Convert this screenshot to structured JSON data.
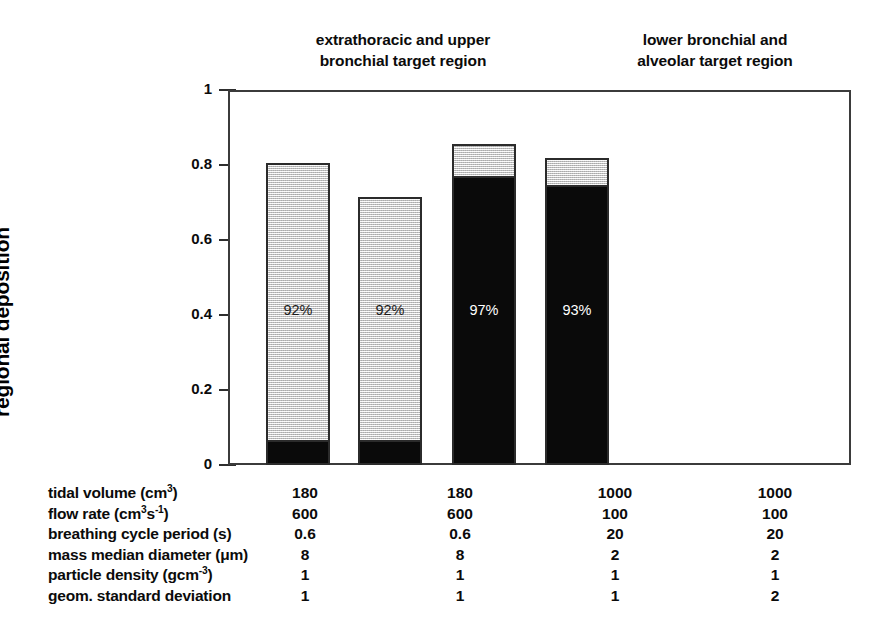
{
  "chart_data": {
    "type": "bar",
    "title": "",
    "subtitle": "",
    "xlabel": "",
    "ylabel": "regional deposition",
    "ylim": [
      0,
      1
    ],
    "yticks": [
      "0",
      "0.2",
      "0.4",
      "0.6",
      "0.8",
      "1"
    ],
    "ytick_values": [
      0,
      0.2,
      0.4,
      0.6,
      0.8,
      1
    ],
    "grid": false,
    "legend": "none",
    "stacked": true,
    "group_headers": [
      {
        "line1": "extrathoracic and upper",
        "line2": "bronchial target region",
        "columns": [
          0,
          1
        ]
      },
      {
        "line1": "lower bronchial and",
        "line2": "alveolar target region",
        "columns": [
          2,
          3
        ]
      }
    ],
    "series": [
      {
        "name": "dark segment",
        "color": "#0a0a0a",
        "values": [
          0.058,
          0.058,
          0.77,
          0.747
        ]
      },
      {
        "name": "light segment",
        "color": "#dcdcdc",
        "values": [
          0.747,
          0.657,
          0.086,
          0.073
        ]
      }
    ],
    "bars": [
      {
        "index": 0,
        "total": 0.805,
        "dark": 0.058,
        "light": 0.747,
        "label": "92%",
        "label_on": "light",
        "dark_position": "bottom"
      },
      {
        "index": 1,
        "total": 0.715,
        "dark": 0.058,
        "light": 0.657,
        "label": "92%",
        "label_on": "light",
        "dark_position": "bottom"
      },
      {
        "index": 2,
        "total": 0.856,
        "dark": 0.77,
        "light": 0.086,
        "label": "97%",
        "label_on": "dark",
        "dark_position": "bottom"
      },
      {
        "index": 3,
        "total": 0.82,
        "dark": 0.747,
        "light": 0.073,
        "label": "93%",
        "label_on": "dark",
        "dark_position": "bottom"
      }
    ],
    "parameter_table": {
      "rows": [
        {
          "label_parts": [
            {
              "t": "tidal volume (cm"
            },
            {
              "t": "3",
              "sup": true
            },
            {
              "t": ")"
            }
          ],
          "label_plain": "tidal volume (cm3)",
          "values": [
            "180",
            "180",
            "1000",
            "1000"
          ]
        },
        {
          "label_parts": [
            {
              "t": "flow rate (cm"
            },
            {
              "t": "3",
              "sup": true
            },
            {
              "t": "s"
            },
            {
              "t": "-1",
              "sup": true
            },
            {
              "t": ")"
            }
          ],
          "label_plain": "flow rate (cm3s-1)",
          "values": [
            "600",
            "600",
            "100",
            "100"
          ]
        },
        {
          "label_parts": [
            {
              "t": "breathing cycle period (s)"
            }
          ],
          "label_plain": "breathing cycle period (s)",
          "values": [
            "0.6",
            "0.6",
            "20",
            "20"
          ]
        },
        {
          "label_parts": [
            {
              "t": "mass median diameter (μm)"
            }
          ],
          "label_plain": "mass median diameter (μm)",
          "values": [
            "8",
            "8",
            "2",
            "2"
          ]
        },
        {
          "label_parts": [
            {
              "t": "particle density (gcm"
            },
            {
              "t": "-3",
              "sup": true
            },
            {
              "t": ")"
            }
          ],
          "label_plain": "particle density (gcm-3)",
          "values": [
            "1",
            "1",
            "1",
            "1"
          ]
        },
        {
          "label_parts": [
            {
              "t": "geom. standard deviation"
            }
          ],
          "label_plain": "geom. standard deviation",
          "values": [
            "1",
            "1",
            "1",
            "2"
          ]
        }
      ]
    }
  },
  "colors": {
    "light_segment": "#dcdcdc",
    "dark_segment": "#0a0a0a",
    "outline": "#2b2b2b",
    "axis": "#3b3b3b",
    "text": "#0b0b0b",
    "label_on_dark": "#ffffff"
  }
}
